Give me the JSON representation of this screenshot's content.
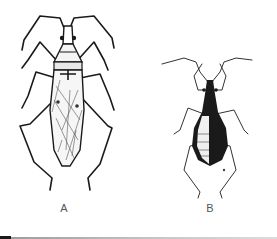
{
  "figure": {
    "panels": [
      {
        "id": "A",
        "label": "A",
        "subject": "winged insect, dorsal view, line drawing"
      },
      {
        "id": "B",
        "label": "B",
        "subject": "wingless insect nymph, dorsal view, dark body"
      }
    ],
    "colors": {
      "background": "#ffffff",
      "ink": "#1a1a1a",
      "label": "#555555",
      "rule": "#a8a8a8"
    }
  }
}
